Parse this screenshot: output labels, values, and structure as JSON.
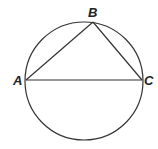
{
  "diagram": {
    "type": "inscribed-triangle",
    "circle": {
      "cx": 84,
      "cy": 81,
      "r": 59
    },
    "points": {
      "A": {
        "label": "A",
        "x": 26,
        "y": 80
      },
      "B": {
        "label": "B",
        "x": 93,
        "y": 22
      },
      "C": {
        "label": "C",
        "x": 142,
        "y": 80
      }
    },
    "segments": [
      "AB",
      "BC",
      "AC"
    ],
    "stroke_color": "#333333"
  }
}
